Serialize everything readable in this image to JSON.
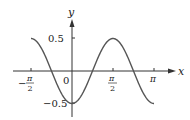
{
  "chart_data": {
    "type": "line",
    "title": "",
    "function": "y = -0.5 cos(2x)",
    "xlabel": "x",
    "ylabel": "y",
    "xlim": [
      -1.5708,
      3.1416
    ],
    "ylim": [
      -0.5,
      0.5
    ],
    "grid": false,
    "legend": null,
    "x_ticks": [
      {
        "value": -1.5708,
        "label_num": "π",
        "label_den": "2",
        "sign": "−"
      },
      {
        "value": 1.5708,
        "label_num": "π",
        "label_den": "2",
        "sign": ""
      },
      {
        "value": 3.1416,
        "label": "π"
      }
    ],
    "y_ticks": [
      {
        "value": 0.5,
        "label": "0.5"
      },
      {
        "value": -0.5,
        "label": "−0.5"
      }
    ],
    "origin_label": "0",
    "series": [
      {
        "name": "y = -0.5cos(2x)",
        "x": [
          -1.5708,
          -1.1781,
          -0.7854,
          -0.3927,
          0,
          0.3927,
          0.7854,
          1.1781,
          1.5708,
          1.9635,
          2.3562,
          2.7489,
          3.1416
        ],
        "y": [
          0.5,
          0.354,
          0,
          -0.354,
          -0.5,
          -0.354,
          0,
          0.354,
          0.5,
          0.354,
          0,
          -0.354,
          -0.5
        ],
        "color": "#555555"
      }
    ]
  },
  "labels": {
    "x_axis": "x",
    "y_axis": "y",
    "origin": "0",
    "y_pos": "0.5",
    "y_neg": "−0.5",
    "neg_pi_half_sign": "−",
    "pi": "π",
    "two": "2"
  }
}
